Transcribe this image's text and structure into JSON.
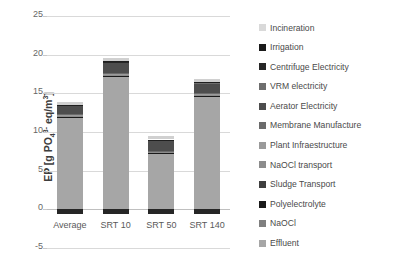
{
  "chart_data": {
    "type": "bar",
    "subtype": "stacked-bar",
    "title": "",
    "xlabel": "",
    "ylabel": "EP [g PO4 3- eq/m3]",
    "ylabel_parts": {
      "prefix": "EP [g PO",
      "sub": "4",
      "sup": "3-",
      "suffix": " eq/m",
      "suffix_sup": "3",
      "close": "]"
    },
    "ylim": [
      -5,
      25
    ],
    "yticks": [
      25,
      20,
      15,
      10,
      5,
      0,
      -5
    ],
    "grid": true,
    "legend_position": "right",
    "categories": [
      "Average",
      "SRT 10",
      "SRT 50",
      "SRT 140"
    ],
    "series": [
      {
        "name": "Effluent",
        "color": "#a6a6a6",
        "values": [
          11.9,
          17.2,
          7.2,
          14.6
        ]
      },
      {
        "name": "NaOCl",
        "color": "#7f7f7f",
        "values": [
          0.05,
          0.05,
          0.05,
          0.05
        ]
      },
      {
        "name": "Polyelectrolyte",
        "color": "#1a1a1a",
        "values": [
          0.05,
          0.05,
          0.05,
          0.05
        ]
      },
      {
        "name": "Sludge Transport",
        "color": "#3f3f3f",
        "values": [
          0.05,
          0.05,
          0.05,
          0.05
        ]
      },
      {
        "name": "NaOCl transport",
        "color": "#8c8c8c",
        "values": [
          0.05,
          0.05,
          0.05,
          0.05
        ]
      },
      {
        "name": "Plant Infraestructure",
        "color": "#9a9a9a",
        "values": [
          0.08,
          0.08,
          0.08,
          0.08
        ]
      },
      {
        "name": "Membrane Manufacture",
        "color": "#6b6b6b",
        "values": [
          0.1,
          0.1,
          0.1,
          0.1
        ]
      },
      {
        "name": "Aerator Electricity",
        "color": "#4d4d4d",
        "values": [
          1.05,
          1.35,
          1.25,
          1.3
        ]
      },
      {
        "name": "VRM electricity",
        "color": "#6e6e6e",
        "values": [
          0.12,
          0.12,
          0.12,
          0.12
        ]
      },
      {
        "name": "Centrifuge Electricity",
        "color": "#262626",
        "values": [
          0.04,
          0.04,
          0.04,
          0.04
        ]
      },
      {
        "name": "Irrigation",
        "color": "#1f1f1f",
        "values": [
          0.04,
          0.04,
          0.04,
          0.04
        ]
      },
      {
        "name": "Incineration",
        "color": "#d0d0d0",
        "values": [
          0.4,
          0.4,
          0.4,
          0.4
        ]
      }
    ],
    "negative_series": [
      {
        "name": "Irrigation",
        "color": "#262626",
        "values": [
          -0.55,
          -0.55,
          -0.55,
          -0.55
        ]
      }
    ],
    "totals": [
      13.5,
      19.2,
      8.9,
      16.4
    ]
  },
  "legend": {
    "items": [
      {
        "label": "Incineration",
        "color": "#d9d9d9"
      },
      {
        "label": "Irrigation",
        "color": "#1a1a1a"
      },
      {
        "label": "Centrifuge Electricity",
        "color": "#262626"
      },
      {
        "label": "VRM electricity",
        "color": "#6e6e6e"
      },
      {
        "label": "Aerator Electricity",
        "color": "#4d4d4d"
      },
      {
        "label": "Membrane Manufacture",
        "color": "#6b6b6b"
      },
      {
        "label": "Plant Infraestructure",
        "color": "#9a9a9a"
      },
      {
        "label": "NaOCl transport",
        "color": "#8c8c8c"
      },
      {
        "label": "Sludge Transport",
        "color": "#3f3f3f"
      },
      {
        "label": "Polyelectrolyte",
        "color": "#1a1a1a"
      },
      {
        "label": "NaOCl",
        "color": "#7f7f7f"
      },
      {
        "label": "Effluent",
        "color": "#a6a6a6"
      }
    ]
  }
}
